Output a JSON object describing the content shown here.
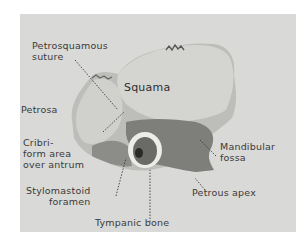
{
  "figure": {
    "colors": {
      "background": "#ffffff",
      "panel": "#d9d9d7",
      "bone_light": "#cfcfcb",
      "bone_mid": "#9a9a96",
      "bone_dark": "#5a5a58",
      "text": "#3a3a3a"
    },
    "labels": {
      "petrosquamous_suture": "Petrosquamous\nsuture",
      "squama": "Squama",
      "petrosa": "Petrosa",
      "cribriform_area": "Cribri-\nform area\nover antrum",
      "mandibular_fossa": "Mandibular\nfossa",
      "stylomastoid_foramen": "Stylomastoid\nforamen",
      "petrous_apex": "Petrous apex",
      "tympanic_bone": "Tympanic bone"
    }
  }
}
